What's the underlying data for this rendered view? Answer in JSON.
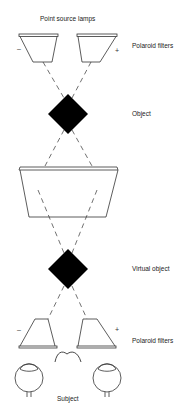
{
  "labels": {
    "lamps": "Point source lamps",
    "polaroid_top": "Polaroid filters",
    "object": "Object",
    "virtual_object": "Virtual object",
    "polaroid_bottom": "Polaroid filters",
    "subject": "Subject"
  },
  "signs": {
    "top_left": "–",
    "top_right": "+",
    "bottom_left": "–",
    "bottom_right": "+"
  },
  "colors": {
    "line": "#333333",
    "fill": "#000000"
  }
}
